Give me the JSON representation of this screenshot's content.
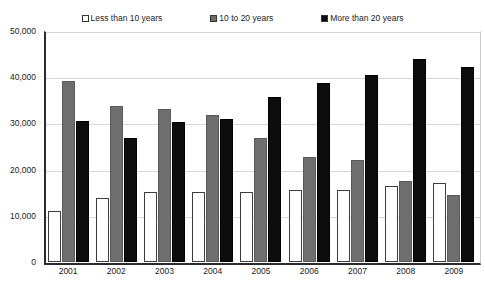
{
  "chart_data": {
    "type": "bar",
    "title": "",
    "subtitle": "",
    "xlabel": "",
    "ylabel": "",
    "categories": [
      "2001",
      "2002",
      "2003",
      "2004",
      "2005",
      "2006",
      "2007",
      "2008",
      "2009"
    ],
    "series": [
      {
        "name": "Less than 10 years",
        "color": "#ffffff",
        "values": [
          11000,
          13800,
          15100,
          15200,
          15200,
          15500,
          15600,
          16400,
          17000
        ]
      },
      {
        "name": "10 to 20 years",
        "color": "#6e6e6e",
        "values": [
          39200,
          33800,
          33200,
          31900,
          26900,
          22800,
          22100,
          17500,
          14500
        ]
      },
      {
        "name": "More than 20 years",
        "color": "#0d0d0d",
        "values": [
          30500,
          26800,
          30400,
          30900,
          35700,
          38800,
          40400,
          44000,
          42300
        ]
      }
    ],
    "ylim": [
      0,
      50000
    ],
    "y_ticks": [
      0,
      10000,
      20000,
      30000,
      40000,
      50000
    ],
    "y_tick_labels": [
      "0",
      "10,000",
      "20,000",
      "30,000",
      "40,000",
      "50,000"
    ],
    "grid": true,
    "legend_position": "top"
  },
  "legend": {
    "items": [
      {
        "label": "Less than 10 years"
      },
      {
        "label": "10 to 20 years"
      },
      {
        "label": "More than 20 years"
      }
    ]
  }
}
